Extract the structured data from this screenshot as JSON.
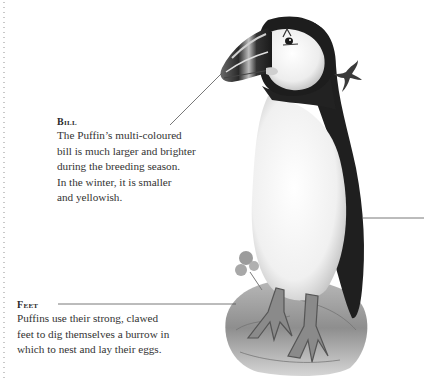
{
  "annotations": {
    "bill": {
      "heading": "Bill",
      "lines": [
        "The Puffin’s multi-coloured",
        "bill is much larger and brighter",
        "during the breeding season.",
        "In the winter, it is smaller",
        "and yellowish."
      ]
    },
    "feet": {
      "heading": "Feet",
      "lines": [
        "Puffins use their strong, clawed",
        "feet to dig themselves a burrow in",
        "which to nest and lay their eggs."
      ]
    }
  },
  "illustration": {
    "subject": "puffin",
    "colors": {
      "plumage_dark": "#1e1e1e",
      "belly": "#f4f4f4",
      "face": "#ececec",
      "rock": "#9a9a9a",
      "leader_line": "#555555"
    }
  }
}
